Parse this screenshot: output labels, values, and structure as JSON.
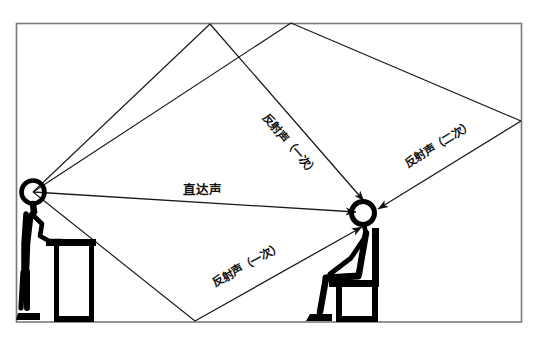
{
  "figure": {
    "title": "室内声场传播示意图",
    "description": "一位站立讲话者与一位坐着的听者之间的直达声与反射声路径示意图",
    "frame": {
      "stroke_color": "#7a7a7a",
      "fill_color": "#ffffff",
      "left": 16,
      "top": 23,
      "right": 522,
      "bottom": 322
    },
    "line_color": "#1a1a1a",
    "figure_color": "#000000"
  },
  "labels": {
    "direct_sound": "直达声",
    "reflection_first_ceiling": "反射声（一次）",
    "reflection_first_floor": "反射声（一次）",
    "reflection_second": "反射声（二次）"
  },
  "actors": {
    "speaker": {
      "name": "讲话者",
      "head_x": 33,
      "head_y": 192,
      "prop": "讲台"
    },
    "listener": {
      "name": "听者",
      "head_x": 363,
      "head_y": 213,
      "prop": "座椅"
    }
  },
  "reflection_points": {
    "ceiling": {
      "x": 210,
      "y": 24
    },
    "floor": {
      "x": 195,
      "y": 321
    },
    "right_wall": {
      "x": 521,
      "y": 121
    }
  },
  "paths": [
    {
      "id": "direct",
      "kind": "direct",
      "label": "直达声",
      "points": "33,192 358,211"
    },
    {
      "id": "ceiling-reflection",
      "kind": "first-order",
      "label": "反射声（一次）",
      "points": "33,192 210,24 358,206"
    },
    {
      "id": "floor-reflection",
      "kind": "first-order",
      "label": "反射声（一次）",
      "points": "33,192 195,321 357,220"
    },
    {
      "id": "double-reflection",
      "kind": "second-order",
      "label": "反射声（二次）",
      "points": "33,192 291,23 521,121 372,208"
    }
  ]
}
